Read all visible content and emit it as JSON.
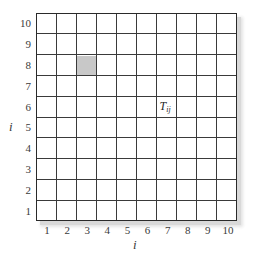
{
  "diagram": {
    "type": "grid",
    "rows": 10,
    "cols": 10,
    "row_labels": [
      "1",
      "2",
      "3",
      "4",
      "5",
      "6",
      "7",
      "8",
      "9",
      "10"
    ],
    "col_labels": [
      "1",
      "2",
      "3",
      "4",
      "5",
      "6",
      "7",
      "8",
      "9",
      "10"
    ],
    "row_axis_label": "i",
    "col_axis_label": "i",
    "shaded_cell": {
      "col": 3,
      "row": 8,
      "color": "#c8c8c8"
    },
    "cell_annotation": {
      "col": 7,
      "row": 6,
      "base": "T",
      "subscript": "ij"
    },
    "colors": {
      "grid_line": "#3a3a3a",
      "border": "#2a2a2a",
      "shadow": "#d9d9d9",
      "text": "#3a3a3a"
    }
  }
}
